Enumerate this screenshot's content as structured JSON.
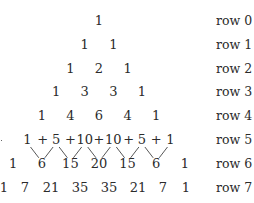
{
  "rows": [
    {
      "label": "row 0",
      "values": [
        "1"
      ]
    },
    {
      "label": "row 1",
      "values": [
        "1",
        "1"
      ]
    },
    {
      "label": "row 2",
      "values": [
        "1",
        "2",
        "1"
      ]
    },
    {
      "label": "row 3",
      "values": [
        "1",
        "3",
        "3",
        "1"
      ]
    },
    {
      "label": "row 4",
      "values": [
        "1",
        "4",
        "6",
        "4",
        "1"
      ]
    },
    {
      "label": "row 5",
      "values": [
        "1",
        "5",
        "10",
        "10",
        "5",
        "1"
      ]
    },
    {
      "label": "row 6",
      "values": [
        "1",
        "6",
        "15",
        "20",
        "15",
        "6",
        "1"
      ]
    },
    {
      "label": "row 7",
      "values": [
        "1",
        "7",
        "21",
        "35",
        "35",
        "21",
        "7",
        "1"
      ]
    }
  ],
  "row5_operator": "+",
  "annotation": "Adjacent entries of row 5 are summed to produce the entries of row 6"
}
